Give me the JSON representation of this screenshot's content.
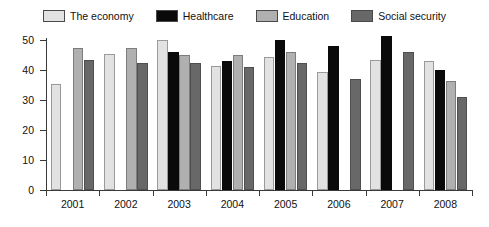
{
  "chart_data": {
    "type": "bar",
    "title": "",
    "xlabel": "",
    "ylabel": "",
    "ylim": [
      0,
      50
    ],
    "yticks": [
      0,
      10,
      20,
      30,
      40,
      50
    ],
    "grid": false,
    "legend_position": "top",
    "categories": [
      "2001",
      "2002",
      "2003",
      "2004",
      "2005",
      "2006",
      "2007",
      "2008"
    ],
    "series": [
      {
        "name": "The economy",
        "color": "#e2e2e2",
        "values": [
          35.5,
          45.5,
          50.0,
          41.5,
          44.5,
          39.5,
          43.5,
          43.0
        ]
      },
      {
        "name": "Healthcare",
        "color": "#0a0a0a",
        "values": [
          null,
          null,
          46.0,
          43.0,
          50.0,
          48.0,
          51.5,
          40.0
        ]
      },
      {
        "name": "Education",
        "color": "#b0b0b0",
        "values": [
          47.5,
          47.5,
          45.0,
          45.0,
          46.0,
          null,
          null,
          36.5
        ]
      },
      {
        "name": "Social security",
        "color": "#686868",
        "values": [
          43.5,
          42.5,
          42.5,
          41.0,
          42.5,
          37.0,
          46.0,
          31.0
        ]
      }
    ]
  },
  "legend": {
    "items": [
      {
        "label": "The economy"
      },
      {
        "label": "Healthcare"
      },
      {
        "label": "Education"
      },
      {
        "label": "Social security"
      }
    ]
  },
  "axes": {
    "y_tick_labels": [
      "0",
      "10",
      "20",
      "30",
      "40",
      "50"
    ],
    "x_tick_labels": [
      "2001",
      "2002",
      "2003",
      "2004",
      "2005",
      "2006",
      "2007",
      "2008"
    ]
  }
}
